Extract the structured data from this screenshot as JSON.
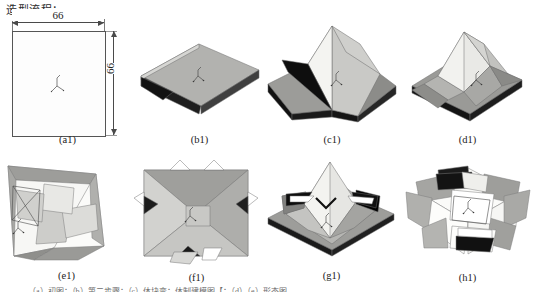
{
  "figure": {
    "title": "造型流程：",
    "footnote": "（a）初图；（b）第二步骤；（c）体块变；体制建模图【；（d）（e）形态图"
  },
  "dimensions": {
    "width_label": "66",
    "height_label": "66",
    "unit_note": ""
  },
  "panels": [
    {
      "id": "a1",
      "caption": "(a1)",
      "description": "flat square sheet with 66 x 66 dimensions"
    },
    {
      "id": "b1",
      "caption": "(b1)",
      "description": "flat slab lifted at one corner"
    },
    {
      "id": "c1",
      "caption": "(c1)",
      "description": "central pyramid raised from base"
    },
    {
      "id": "d1",
      "caption": "(d1)",
      "description": "pyramid with folded side flaps"
    },
    {
      "id": "e1",
      "caption": "(e1)",
      "description": "side view of folded form with inner panel"
    },
    {
      "id": "f1",
      "caption": "(f1)",
      "description": "top view with four corner notches"
    },
    {
      "id": "g1",
      "caption": "(g1)",
      "description": "raised hooded form with openings"
    },
    {
      "id": "h1",
      "caption": "(h1)",
      "description": "final opened form seen from below"
    }
  ],
  "colors": {
    "paper_light": "#eeeeec",
    "paper_mid": "#b9b9b6",
    "paper_dark": "#8e8e8b",
    "shadow": "#1c1c1c",
    "outline": "#5a5a5a",
    "background": "#ffffff"
  }
}
